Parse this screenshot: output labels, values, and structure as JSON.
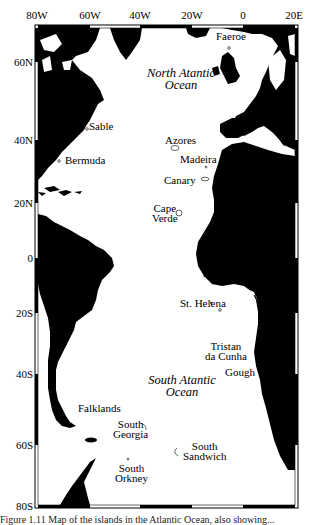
{
  "map": {
    "longitude_ticks": [
      {
        "label": "80W",
        "x": 37
      },
      {
        "label": "60W",
        "x": 90
      },
      {
        "label": "40W",
        "x": 140
      },
      {
        "label": "20W",
        "x": 192
      },
      {
        "label": "0",
        "x": 243
      },
      {
        "label": "20E",
        "x": 294
      }
    ],
    "latitude_ticks": [
      {
        "label": "60N",
        "y": 62
      },
      {
        "label": "40N",
        "y": 140
      },
      {
        "label": "20N",
        "y": 203
      },
      {
        "label": "0",
        "y": 258
      },
      {
        "label": "20S",
        "y": 313
      },
      {
        "label": "40S",
        "y": 374
      },
      {
        "label": "60S",
        "y": 445
      },
      {
        "label": "80S",
        "y": 506
      }
    ],
    "oceans": [
      {
        "line1": "North Atantic",
        "line2": "Ocean"
      },
      {
        "line1": "South Atantic",
        "line2": "Ocean"
      }
    ],
    "islands": {
      "faeroe": "Faeroe",
      "sable": "Sable",
      "bermuda": "Bermuda",
      "azores": "Azores",
      "madeira": "Madeira",
      "canary": "Canary",
      "cape_verde": [
        "Cape",
        "Verde"
      ],
      "ascension": "Ascension",
      "st_helena": "St. Helena",
      "tristan": [
        "Tristan",
        "da Cunha"
      ],
      "gough": "Gough",
      "falklands": "Falklands",
      "south_georgia": [
        "South",
        "Georgia"
      ],
      "south_sandwich": [
        "South",
        "Sandwich"
      ],
      "south_orkney": [
        "South",
        "Orkney"
      ]
    },
    "colors": {
      "land": "#000000",
      "sea": "#ffffff",
      "frame": "#000000"
    }
  },
  "caption": "Figure 1.11  Map of the islands in the Atlantic Ocean, also showing..."
}
